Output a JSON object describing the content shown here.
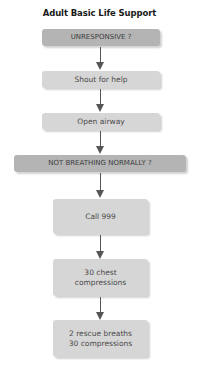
{
  "title": "Adult Basic Life Support",
  "steps": [
    {
      "label": "UNRESPONSIVE ?",
      "style": "decision"
    },
    {
      "label": "Shout for help",
      "style": "action"
    },
    {
      "label": "Open airway",
      "style": "action"
    },
    {
      "label": "NOT BREATHING NORMALLY ?",
      "style": "decision"
    },
    {
      "label": "Call 999",
      "style": "action"
    },
    {
      "label_line1": "30 chest",
      "label_line2": "compressions",
      "style": "action"
    },
    {
      "label_line1": "2 rescue breaths",
      "label_line2": "30 compressions",
      "style": "action"
    }
  ],
  "colors": {
    "decision_fill": "#b4b4b4",
    "action_fill": "#d6d6d6",
    "arrow": "#555555"
  }
}
